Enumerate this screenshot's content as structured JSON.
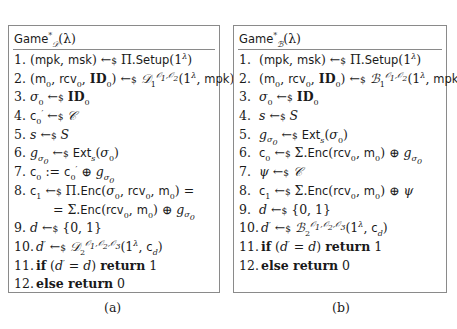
{
  "figure_a": {
    "title": "Game*_D(λ)",
    "title_parts": {
      "name": "Game",
      "sup": "*",
      "sub": "𝒟",
      "arg": "(λ)"
    },
    "lines": [
      {
        "num": "1.",
        "text": "(mpk, msk) ←$ Π.Setup(1^λ)"
      },
      {
        "num": "2.",
        "text": "(m0, rcv0, ID0) ←$ D1^{O1,O2}(1^λ, mpk)"
      },
      {
        "num": "3.",
        "text": "σ0 ←$ ID0"
      },
      {
        "num": "4.",
        "text": "c'0 ←$ C"
      },
      {
        "num": "5.",
        "text": "s ←$ S"
      },
      {
        "num": "6.",
        "text": "g_σ0 ←$ Ext_s(σ0)"
      },
      {
        "num": "7.",
        "text": "c0 := c'0 ⊕ g_σ0"
      },
      {
        "num": "8.",
        "text": "c1 ←$ Π.Enc(σ0, rcv0, m0) ="
      },
      {
        "num": "",
        "text": "= Σ.Enc(rcv0, m0) ⊕ g_σ0"
      },
      {
        "num": "9.",
        "text": "d ←$ {0,1}"
      },
      {
        "num": "10.",
        "text": "d' ←$ D2^{O1,O2,O3}(1^λ, c_d)"
      },
      {
        "num": "11.",
        "text": "if (d' = d) return 1"
      },
      {
        "num": "12.",
        "text": "else return 0"
      }
    ],
    "caption": "(a)"
  },
  "figure_b": {
    "title": "Game*_B(λ)",
    "title_parts": {
      "name": "Game",
      "sup": "*",
      "sub": "ℬ",
      "arg": "(λ)"
    },
    "lines": [
      {
        "num": "1.",
        "text": "(mpk, msk) ←$ Π.Setup(1^λ)"
      },
      {
        "num": "2.",
        "text": "(m0, rcv0, ID0) ←$ B1^{O1,O2}(1^λ, mpk)"
      },
      {
        "num": "3.",
        "text": "σ0 ←$ ID0"
      },
      {
        "num": "4.",
        "text": "s ←$ S"
      },
      {
        "num": "5.",
        "text": "g_σ0 ←$ Ext_s(σ0)"
      },
      {
        "num": "6.",
        "text": "c0 ←$ Σ.Enc(rcv0, m0) ⊕ g_σ0"
      },
      {
        "num": "7.",
        "text": "ψ ←$ C"
      },
      {
        "num": "8.",
        "text": "c1 ←$ Σ.Enc(rcv0, m0) ⊕ ψ"
      },
      {
        "num": "9.",
        "text": "d ←$ {0,1}"
      },
      {
        "num": "10.",
        "text": "d' ←$ B2^{O1,O2,O3}(1^λ, c_d)"
      },
      {
        "num": "11.",
        "text": "if (d' = d) return 1"
      },
      {
        "num": "12.",
        "text": "else return 0"
      }
    ],
    "caption": "(b)"
  },
  "colors": {
    "border": "#8a8a8a",
    "text": "#1a1a1a",
    "background": "#ffffff"
  }
}
